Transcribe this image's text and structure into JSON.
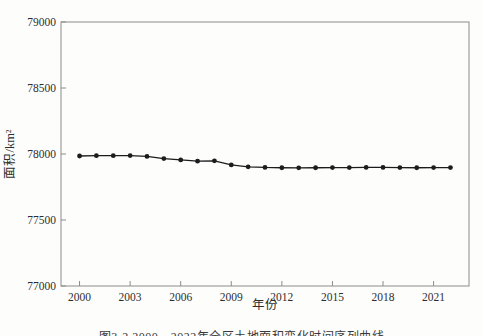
{
  "figure": {
    "xlabel": "年份",
    "ylabel": "面积/km²",
    "caption_clipped": "图3-2 2000—2022年全区土地面积变化时间序列曲线"
  },
  "chart_data": {
    "type": "line",
    "title": "",
    "xlabel": "年份",
    "ylabel": "面积/km²",
    "x": [
      2000,
      2001,
      2002,
      2003,
      2004,
      2005,
      2006,
      2007,
      2008,
      2009,
      2010,
      2011,
      2012,
      2013,
      2014,
      2015,
      2016,
      2017,
      2018,
      2019,
      2020,
      2021,
      2022
    ],
    "series": [
      {
        "name": "面积",
        "values": [
          77985,
          77987,
          77987,
          77988,
          77982,
          77965,
          77955,
          77946,
          77948,
          77917,
          77903,
          77898,
          77896,
          77895,
          77896,
          77897,
          77897,
          77898,
          77898,
          77897,
          77896,
          77897,
          77897
        ]
      }
    ],
    "xticks": [
      2000,
      2003,
      2006,
      2009,
      2012,
      2015,
      2018,
      2021
    ],
    "yticks": [
      77000,
      77500,
      78000,
      78500,
      79000
    ],
    "xlim": [
      1998.9,
      2023.1
    ],
    "ylim": [
      77000,
      79000
    ],
    "grid": false,
    "legend": "none",
    "marker": "filled-circle",
    "line_color": "#1c1c1c",
    "marker_color": "#1c1c1c",
    "axis_color": "#8c8c8c",
    "text_color": "#2e2e2e"
  }
}
